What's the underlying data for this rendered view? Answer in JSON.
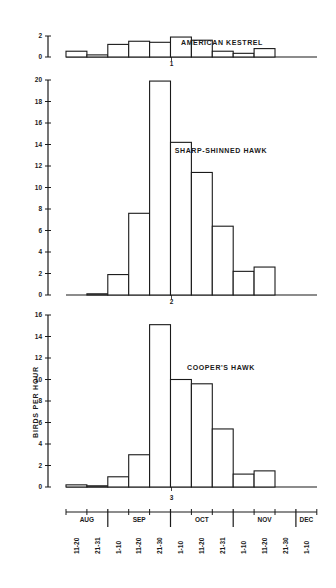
{
  "chart_data": [
    {
      "type": "bar",
      "panel_index": "1",
      "title": "AMERICAN KESTREL",
      "xlabel": "",
      "ylabel": "",
      "ylim": [
        0,
        2
      ],
      "yticks": [
        0,
        2
      ],
      "grid": false,
      "categories": [
        "AUG 11-20",
        "AUG 21-31",
        "SEP 1-10",
        "SEP 11-20",
        "SEP 21-30",
        "OCT 1-10",
        "OCT 11-20",
        "OCT 21-31",
        "NOV 1-10",
        "NOV 11-20",
        "NOV 21-30",
        "DEC 1-10"
      ],
      "values": [
        0.55,
        0.2,
        1.2,
        1.5,
        1.4,
        1.9,
        1.6,
        0.55,
        0.35,
        0.8,
        0,
        0
      ]
    },
    {
      "type": "bar",
      "panel_index": "2",
      "title": "SHARP-SHINNED HAWK",
      "xlabel": "",
      "ylabel": "",
      "ylim": [
        0,
        20
      ],
      "yticks": [
        0,
        2,
        4,
        6,
        8,
        10,
        12,
        14,
        16,
        18,
        20
      ],
      "grid": false,
      "categories": [
        "AUG 11-20",
        "AUG 21-31",
        "SEP 1-10",
        "SEP 11-20",
        "SEP 21-30",
        "OCT 1-10",
        "OCT 11-20",
        "OCT 21-31",
        "NOV 1-10",
        "NOV 11-20",
        "NOV 21-30",
        "DEC 1-10"
      ],
      "values": [
        0,
        0.1,
        1.9,
        7.6,
        19.9,
        14.2,
        11.4,
        6.4,
        2.2,
        2.6,
        0,
        0
      ]
    },
    {
      "type": "bar",
      "panel_index": "3",
      "title": "COOPER'S HAWK",
      "xlabel": "",
      "ylabel": "BIRDS PER HOUR",
      "ylim": [
        0,
        16
      ],
      "yticks": [
        0,
        2,
        4,
        6,
        8,
        10,
        12,
        14,
        16
      ],
      "grid": false,
      "categories": [
        "AUG 11-20",
        "AUG 21-31",
        "SEP 1-10",
        "SEP 11-20",
        "SEP 21-30",
        "OCT 1-10",
        "OCT 11-20",
        "OCT 21-31",
        "NOV 1-10",
        "NOV 11-20",
        "NOV 21-30",
        "DEC 1-10"
      ],
      "values": [
        0.2,
        0.1,
        0.95,
        3.0,
        15.1,
        10.0,
        9.6,
        5.4,
        1.2,
        1.5,
        0,
        0
      ]
    }
  ],
  "x_axis": {
    "months": [
      {
        "label": "AUG",
        "start": 0,
        "span": 2
      },
      {
        "label": "SEP",
        "start": 2,
        "span": 3
      },
      {
        "label": "OCT",
        "start": 5,
        "span": 3
      },
      {
        "label": "NOV",
        "start": 8,
        "span": 3
      },
      {
        "label": "DEC",
        "start": 11,
        "span": 1
      }
    ],
    "periods": [
      "11-20",
      "21-31",
      "1-10",
      "11-20",
      "21-30",
      "1-10",
      "11-20",
      "21-31",
      "1-10",
      "11-20",
      "21-30",
      "1-10"
    ]
  },
  "y_axis_title": "BIRDS PER HOUR",
  "colors": {
    "ink": "#1a1a1a",
    "bar_fill": "#ffffff",
    "background": "#ffffff"
  }
}
